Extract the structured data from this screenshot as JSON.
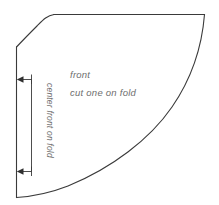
{
  "diagram": {
    "background_color": "#ffffff",
    "outline_color": "#3a3a3a",
    "text_color": "#6e6e6e",
    "labels": {
      "piece_name": "front",
      "cutting_instruction": "cut one on fold",
      "dimension_label": "center front on fold"
    },
    "icons": {
      "arrow_top": "arrow-left-icon",
      "arrow_bottom": "arrow-left-icon"
    }
  }
}
